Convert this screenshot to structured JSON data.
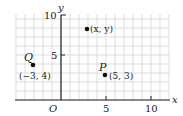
{
  "chart_data": {
    "type": "scatter",
    "title": "",
    "xlabel": "x",
    "ylabel": "y",
    "origin_label": "O",
    "xlim": [
      -5,
      12
    ],
    "ylim": [
      0,
      10.5
    ],
    "x_ticks": [
      5,
      10
    ],
    "y_ticks": [
      5,
      10
    ],
    "grid": true,
    "points": [
      {
        "name": "Q",
        "x": -3,
        "y": 4,
        "label": "(−3, 4)"
      },
      {
        "name": "P",
        "x": 5,
        "y": 3,
        "label": "(5, 3)"
      },
      {
        "name": "",
        "x": 3,
        "y": 8,
        "label": "(x, y)"
      }
    ]
  },
  "labels": {
    "x_axis": "x",
    "y_axis": "y",
    "origin": "O",
    "tick_x_5": "5",
    "tick_x_10": "10",
    "tick_y_5": "5",
    "tick_y_10": "10",
    "point_q_name": "Q",
    "point_q_coords": "(−3, 4)",
    "point_p_name": "P",
    "point_p_coords": "(5, 3)",
    "point_xy_coords": "(x, y)"
  },
  "colors": {
    "grid": "#d4d4d4",
    "axis": "#222222",
    "point": "#111111"
  }
}
